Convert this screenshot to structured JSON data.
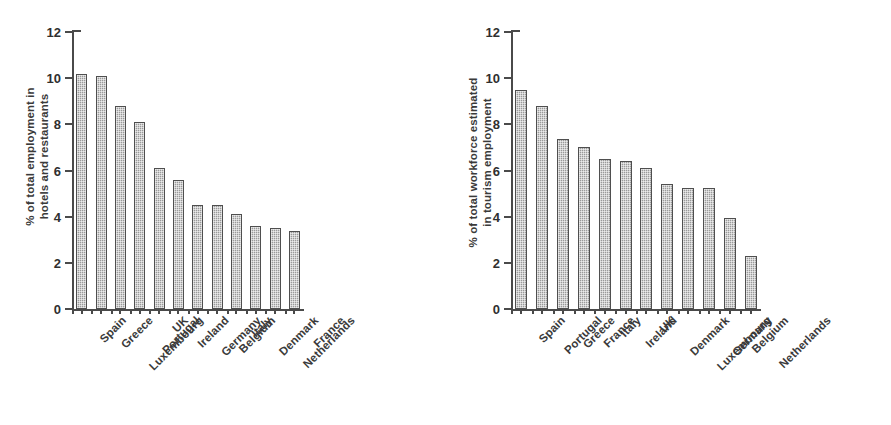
{
  "chart_data": [
    {
      "type": "bar",
      "panel": "left",
      "title": "",
      "ylabel_line1": "% of total employment in",
      "ylabel_line2": "hotels and restaurants",
      "xlabel": "",
      "ylim": [
        0,
        12
      ],
      "yticks": [
        0,
        2,
        4,
        6,
        8,
        10,
        12
      ],
      "ytick_labels": [
        "0",
        "2",
        "4",
        "6",
        "8",
        "10",
        "12"
      ],
      "grid": false,
      "legend": false,
      "categories": [
        "Spain",
        "Greece",
        "Luxembourg",
        "Portugal",
        "UK",
        "Ireland",
        "Germany",
        "Belgium",
        "Italy",
        "Denmark",
        "Netherlands",
        "France"
      ],
      "values": [
        10.2,
        10.1,
        8.8,
        8.1,
        6.1,
        5.6,
        4.5,
        4.5,
        4.1,
        3.6,
        3.5,
        3.4
      ]
    },
    {
      "type": "bar",
      "panel": "right",
      "title": "",
      "ylabel_line1": "% of total workforce estimated",
      "ylabel_line2": "in tourism employment",
      "xlabel": "",
      "ylim": [
        0,
        12
      ],
      "yticks": [
        0,
        2,
        4,
        6,
        8,
        10,
        12
      ],
      "ytick_labels": [
        "0",
        "2",
        "4",
        "6",
        "8",
        "10",
        "12"
      ],
      "grid": false,
      "legend": false,
      "categories": [
        "Spain",
        "Portugal",
        "Greece",
        "France",
        "Italy",
        "Ireland",
        "UK",
        "Denmark",
        "Luxembourg",
        "Germany",
        "Belgium",
        "Netherlands"
      ],
      "values": [
        9.5,
        8.8,
        7.35,
        7.0,
        6.5,
        6.4,
        6.1,
        5.4,
        5.25,
        5.25,
        3.95,
        2.3
      ]
    }
  ],
  "style": {
    "bar_fill": "#9a9a9a",
    "bar_border": "#4f4f4f",
    "axis_color": "#4a4a4a",
    "text_color": "#3a3a3a",
    "background": "#ffffff"
  }
}
